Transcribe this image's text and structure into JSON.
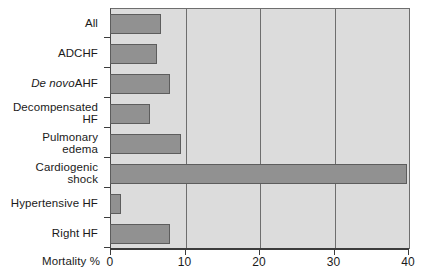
{
  "chart_data": {
    "type": "bar",
    "orientation": "horizontal",
    "title": "",
    "xlabel": "Mortality %",
    "ylabel": "",
    "xlim": [
      0,
      40
    ],
    "xticks": [
      0,
      10,
      20,
      30,
      40
    ],
    "xtick_labels": [
      "0",
      "10",
      "20",
      "30",
      "40"
    ],
    "grid": true,
    "grid_axis": "x",
    "legend": false,
    "categories": [
      "All",
      "ADCHF",
      "De novo AHF",
      "Decompensated HF",
      "Pulmonary edema",
      "Cardiogenic shock",
      "Hypertensive HF",
      "Right HF"
    ],
    "values": [
      6.8,
      6.3,
      8.1,
      5.4,
      9.5,
      39.8,
      1.5,
      8.1
    ],
    "series": [
      {
        "name": "Mortality %",
        "values": [
          6.8,
          6.3,
          8.1,
          5.4,
          9.5,
          39.8,
          1.5,
          8.1
        ]
      }
    ]
  },
  "axis": {
    "x_title": "Mortality %",
    "tick_labels": [
      "0",
      "10",
      "20",
      "30",
      "40"
    ]
  },
  "categories": [
    {
      "label": "All",
      "italic_part": "",
      "roman_part": "All",
      "value": 6.8
    },
    {
      "label": "ADCHF",
      "italic_part": "",
      "roman_part": "ADCHF",
      "value": 6.3
    },
    {
      "label": "De novo AHF",
      "italic_part": "De novo",
      "roman_part": " AHF",
      "value": 8.1
    },
    {
      "label": "Decompensated HF",
      "italic_part": "",
      "roman_part": "Decompensated HF",
      "value": 5.4
    },
    {
      "label": "Pulmonary edema",
      "italic_part": "",
      "roman_part": "Pulmonary\nedema",
      "value": 9.5
    },
    {
      "label": "Cardiogenic shock",
      "italic_part": "",
      "roman_part": "Cardiogenic\nshock",
      "value": 39.8
    },
    {
      "label": "Hypertensive HF",
      "italic_part": "",
      "roman_part": "Hypertensive HF",
      "value": 1.5
    },
    {
      "label": "Right HF",
      "italic_part": "",
      "roman_part": "Right HF",
      "value": 8.1
    }
  ],
  "colors": {
    "bar_fill": "#919191",
    "bar_edge": "#5d5d5d",
    "plot_background": "#dcdcdc",
    "gridline": "#6e6e6e",
    "axis": "#3c3c3c",
    "page_background": "#ffffff",
    "text": "#1a1a1a"
  }
}
